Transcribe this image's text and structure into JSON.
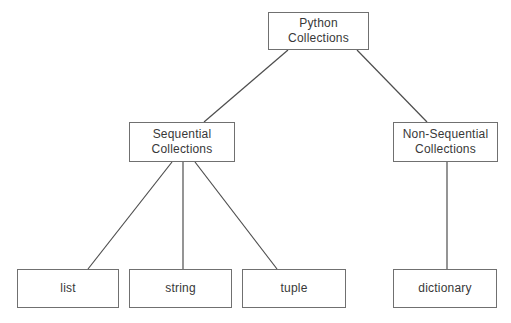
{
  "diagram": {
    "type": "tree",
    "nodes": {
      "python_collections": {
        "line1": "Python",
        "line2": "Collections"
      },
      "sequential": {
        "line1": "Sequential",
        "line2": "Collections"
      },
      "non_sequential": {
        "line1": "Non-Sequential",
        "line2": "Collections"
      },
      "list": {
        "label": "list"
      },
      "string": {
        "label": "string"
      },
      "tuple": {
        "label": "tuple"
      },
      "dictionary": {
        "label": "dictionary"
      }
    },
    "edges": [
      {
        "from": "python_collections",
        "to": "sequential"
      },
      {
        "from": "python_collections",
        "to": "non_sequential"
      },
      {
        "from": "sequential",
        "to": "list"
      },
      {
        "from": "sequential",
        "to": "string"
      },
      {
        "from": "sequential",
        "to": "tuple"
      },
      {
        "from": "non_sequential",
        "to": "dictionary"
      }
    ],
    "colors": {
      "background": "#ffffff",
      "box_fill": "#ffffff",
      "box_border": "#707070",
      "edge_line": "#4d4d4d",
      "text": "#383838"
    }
  }
}
